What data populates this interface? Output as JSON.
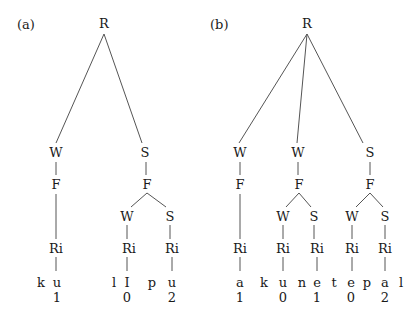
{
  "panels": [
    {
      "label": "(a)",
      "label_pos": [
        17,
        29
      ],
      "nodes": [
        {
          "id": "R",
          "text": "R",
          "x": 104,
          "y": 28
        },
        {
          "id": "W1",
          "text": "W",
          "x": 56,
          "y": 157
        },
        {
          "id": "S1",
          "text": "S",
          "x": 145,
          "y": 157
        },
        {
          "id": "F1",
          "text": "F",
          "x": 56,
          "y": 189
        },
        {
          "id": "F2",
          "text": "F",
          "x": 147,
          "y": 189
        },
        {
          "id": "W2",
          "text": "W",
          "x": 127,
          "y": 221
        },
        {
          "id": "S2",
          "text": "S",
          "x": 170,
          "y": 221
        },
        {
          "id": "Ri1",
          "text": "Ri",
          "x": 56,
          "y": 253
        },
        {
          "id": "Ri2",
          "text": "Ri",
          "x": 129,
          "y": 253
        },
        {
          "id": "Ri3",
          "text": "Ri",
          "x": 172,
          "y": 253
        }
      ],
      "edges": [
        [
          104,
          34,
          56,
          143
        ],
        [
          104,
          34,
          142,
          143
        ],
        [
          56,
          162,
          56,
          175
        ],
        [
          146,
          162,
          146,
          175
        ],
        [
          56,
          194,
          56,
          239
        ],
        [
          147,
          193,
          131,
          207
        ],
        [
          147,
          193,
          166,
          207
        ],
        [
          127,
          225,
          127,
          239
        ],
        [
          170,
          225,
          170,
          239
        ],
        [
          56,
          257,
          56,
          271
        ],
        [
          127,
          257,
          127,
          271
        ],
        [
          172,
          257,
          172,
          271
        ]
      ],
      "segments": [
        {
          "text": "k",
          "x": 41,
          "y": 287
        },
        {
          "text": "u",
          "x": 57,
          "y": 287
        },
        {
          "text": "l",
          "x": 114,
          "y": 287
        },
        {
          "text": "I",
          "x": 127,
          "y": 287
        },
        {
          "text": "p",
          "x": 152,
          "y": 287
        },
        {
          "text": "u",
          "x": 172,
          "y": 287
        }
      ],
      "tones": [
        {
          "text": "1",
          "x": 57,
          "y": 302
        },
        {
          "text": "0",
          "x": 127,
          "y": 302
        },
        {
          "text": "2",
          "x": 172,
          "y": 302
        }
      ]
    },
    {
      "label": "(b)",
      "label_pos": [
        210,
        29
      ],
      "nodes": [
        {
          "id": "R",
          "text": "R",
          "x": 307,
          "y": 28
        },
        {
          "id": "W1",
          "text": "W",
          "x": 240,
          "y": 157
        },
        {
          "id": "W2",
          "text": "W",
          "x": 298,
          "y": 157
        },
        {
          "id": "S1",
          "text": "S",
          "x": 370,
          "y": 157
        },
        {
          "id": "F1",
          "text": "F",
          "x": 240,
          "y": 189
        },
        {
          "id": "F2",
          "text": "F",
          "x": 299,
          "y": 189
        },
        {
          "id": "F3",
          "text": "F",
          "x": 370,
          "y": 189
        },
        {
          "id": "W3",
          "text": "W",
          "x": 283,
          "y": 221
        },
        {
          "id": "S2",
          "text": "S",
          "x": 314,
          "y": 221
        },
        {
          "id": "W4",
          "text": "W",
          "x": 352,
          "y": 221
        },
        {
          "id": "S3",
          "text": "S",
          "x": 385,
          "y": 221
        },
        {
          "id": "Ri1",
          "text": "Ri",
          "x": 240,
          "y": 253
        },
        {
          "id": "Ri2",
          "text": "Ri",
          "x": 283,
          "y": 253
        },
        {
          "id": "Ri3",
          "text": "Ri",
          "x": 317,
          "y": 253
        },
        {
          "id": "Ri4",
          "text": "Ri",
          "x": 352,
          "y": 253
        },
        {
          "id": "Ri5",
          "text": "Ri",
          "x": 385,
          "y": 253
        }
      ],
      "edges": [
        [
          307,
          34,
          239,
          143
        ],
        [
          307,
          34,
          297,
          143
        ],
        [
          307,
          34,
          363,
          143
        ],
        [
          240,
          162,
          240,
          175
        ],
        [
          298,
          162,
          298,
          175
        ],
        [
          370,
          162,
          370,
          175
        ],
        [
          240,
          194,
          240,
          239
        ],
        [
          299,
          193,
          286,
          207
        ],
        [
          299,
          193,
          311,
          207
        ],
        [
          370,
          193,
          356,
          207
        ],
        [
          370,
          193,
          383,
          207
        ],
        [
          283,
          225,
          283,
          239
        ],
        [
          314,
          225,
          314,
          239
        ],
        [
          352,
          225,
          352,
          239
        ],
        [
          385,
          225,
          385,
          239
        ],
        [
          240,
          257,
          240,
          271
        ],
        [
          283,
          257,
          283,
          271
        ],
        [
          317,
          257,
          317,
          271
        ],
        [
          352,
          257,
          352,
          271
        ],
        [
          385,
          257,
          385,
          271
        ]
      ],
      "segments": [
        {
          "text": "a",
          "x": 240,
          "y": 287
        },
        {
          "text": "k",
          "x": 264,
          "y": 287
        },
        {
          "text": "u",
          "x": 283,
          "y": 287
        },
        {
          "text": "n",
          "x": 302,
          "y": 287
        },
        {
          "text": "e",
          "x": 317,
          "y": 287
        },
        {
          "text": "t",
          "x": 334,
          "y": 287
        },
        {
          "text": "e",
          "x": 351,
          "y": 287
        },
        {
          "text": "p",
          "x": 367,
          "y": 287
        },
        {
          "text": "a",
          "x": 385,
          "y": 287
        },
        {
          "text": "l",
          "x": 401,
          "y": 287
        }
      ],
      "tones": [
        {
          "text": "1",
          "x": 240,
          "y": 302
        },
        {
          "text": "0",
          "x": 283,
          "y": 302
        },
        {
          "text": "1",
          "x": 317,
          "y": 302
        },
        {
          "text": "0",
          "x": 351,
          "y": 302
        },
        {
          "text": "2",
          "x": 385,
          "y": 302
        }
      ]
    }
  ]
}
